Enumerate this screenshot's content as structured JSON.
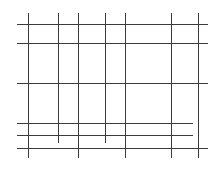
{
  "diagram": {
    "type": "grid-lines",
    "width": 224,
    "height": 171,
    "background": "#ffffff",
    "line_color": "#3a3a3a",
    "stroke_width": 1,
    "vertical_lines": [
      {
        "x": 28,
        "y1": 13,
        "y2": 158
      },
      {
        "x": 58,
        "y1": 13,
        "y2": 143
      },
      {
        "x": 78,
        "y1": 13,
        "y2": 158
      },
      {
        "x": 105,
        "y1": 13,
        "y2": 143
      },
      {
        "x": 125,
        "y1": 13,
        "y2": 158
      },
      {
        "x": 171,
        "y1": 13,
        "y2": 158
      },
      {
        "x": 198,
        "y1": 13,
        "y2": 158
      }
    ],
    "horizontal_lines": [
      {
        "y": 24,
        "x1": 17,
        "x2": 208
      },
      {
        "y": 43,
        "x1": 17,
        "x2": 208
      },
      {
        "y": 83,
        "x1": 17,
        "x2": 208
      },
      {
        "y": 123,
        "x1": 17,
        "x2": 193
      },
      {
        "y": 135,
        "x1": 17,
        "x2": 193
      },
      {
        "y": 148,
        "x1": 17,
        "x2": 208
      }
    ]
  }
}
